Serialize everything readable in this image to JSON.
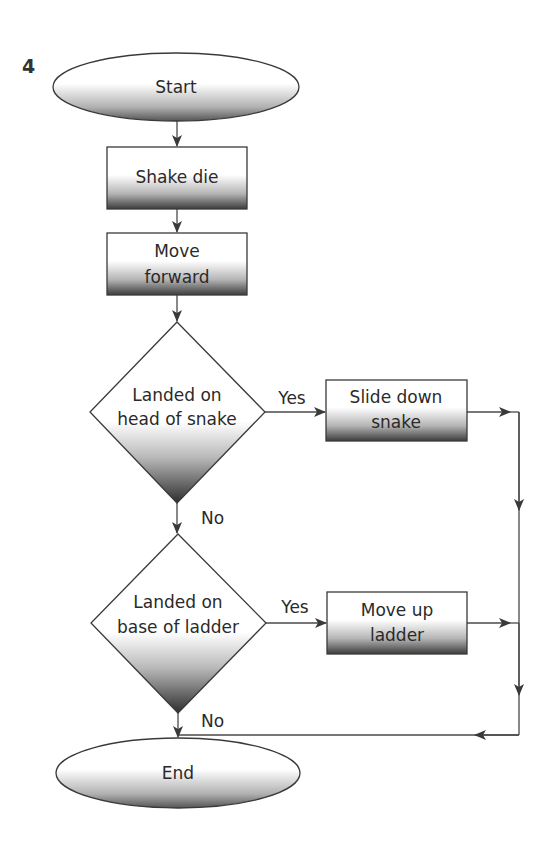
{
  "figure_number": "4",
  "nodes": {
    "start": {
      "label": "Start",
      "shape": "ellipse"
    },
    "shake": {
      "label": "Shake die",
      "shape": "process"
    },
    "move_forward": {
      "line1": "Move",
      "line2": "forward",
      "shape": "process"
    },
    "decision_snake": {
      "line1": "Landed on",
      "line2": "head of snake",
      "shape": "decision"
    },
    "slide_down": {
      "line1": "Slide down",
      "line2": "snake",
      "shape": "process"
    },
    "decision_ladder": {
      "line1": "Landed on",
      "line2": "base of ladder",
      "shape": "decision"
    },
    "move_up": {
      "line1": "Move up",
      "line2": "ladder",
      "shape": "process"
    },
    "end": {
      "label": "End",
      "shape": "ellipse"
    }
  },
  "edges": {
    "snake_yes": "Yes",
    "snake_no": "No",
    "ladder_yes": "Yes",
    "ladder_no": "No"
  },
  "colors": {
    "stroke": "#3a3a3a",
    "fill_top": "#ffffff",
    "fill_bottom": "#3c3c3c"
  }
}
